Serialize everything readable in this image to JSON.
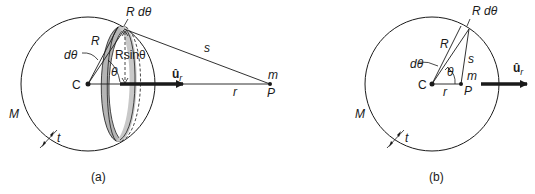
{
  "figure": {
    "panels": [
      {
        "id": "a",
        "caption": "(a)",
        "labels": {
          "mass": "M",
          "thickness": "t",
          "center": "C",
          "radius": "R",
          "dtheta": "dθ",
          "arc": "R dθ",
          "ring_radius": "Rsinθ",
          "theta": "θ",
          "unit_vector": "û",
          "unit_vector_sub": "r",
          "s": "s",
          "r": "r",
          "m": "m",
          "P": "P"
        }
      },
      {
        "id": "b",
        "caption": "(b)",
        "labels": {
          "mass": "M",
          "thickness": "t",
          "center": "C",
          "radius": "R",
          "dtheta": "dθ",
          "arc": "R dθ",
          "theta": "θ",
          "unit_vector": "û",
          "unit_vector_sub": "r",
          "s": "s",
          "r": "r",
          "m": "m",
          "P": "P"
        }
      }
    ],
    "colors": {
      "line": "#1a1a1a",
      "ring_fill": "#b5b5b5",
      "background": "#ffffff"
    }
  }
}
